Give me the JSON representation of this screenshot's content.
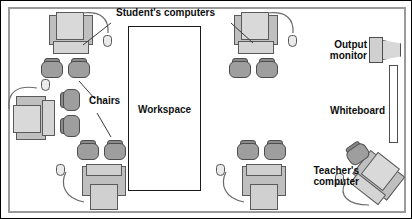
{
  "diagram": {
    "room": {
      "wall_color": "#9a9a9a",
      "floor_color": "#ffffff"
    }
  },
  "labels": {
    "students_computers": "Student's computers",
    "chairs": "Chairs",
    "workspace": "Workspace",
    "output_monitor": "Output\nmonitor",
    "whiteboard": "Whiteboard",
    "teachers_computer": "Teacher's\ncomputer"
  },
  "colors": {
    "outline": "#000000",
    "wall": "#9a9a9a",
    "desk_body": "#bfbfbf",
    "desk_screen": "#d9d9d9",
    "chair": "#9e9e9e",
    "chair_back": "#8a8a8a",
    "text": "#0d0d0d"
  },
  "furniture": {
    "student_desks": [
      {
        "name": "student-desk-top-left",
        "x": 48,
        "y": 14,
        "rotation": 0,
        "chairs": 2
      },
      {
        "name": "student-desk-top-right",
        "x": 233,
        "y": 14,
        "rotation": 0,
        "chairs": 2
      },
      {
        "name": "student-desk-left",
        "x": 14,
        "y": 96,
        "rotation": -90,
        "chairs": 2
      },
      {
        "name": "student-desk-bottom-left",
        "x": 80,
        "y": 165,
        "rotation": 180,
        "chairs": 2
      },
      {
        "name": "student-desk-bottom-right",
        "x": 240,
        "y": 165,
        "rotation": 180,
        "chairs": 2
      }
    ],
    "teacher_desk": {
      "name": "teacher-desk",
      "x": 352,
      "y": 160,
      "rotation": 38,
      "chairs": 1
    },
    "workspace": {
      "x": 127,
      "y": 25,
      "width": 73,
      "height": 165
    },
    "output_monitor": {
      "x": 368,
      "y": 36
    },
    "whiteboard": {
      "x": 388,
      "y": 64,
      "width": 9,
      "height": 78
    }
  },
  "counts": {
    "student_computers": 5,
    "teacher_computers": 1,
    "chairs_total": 11
  }
}
